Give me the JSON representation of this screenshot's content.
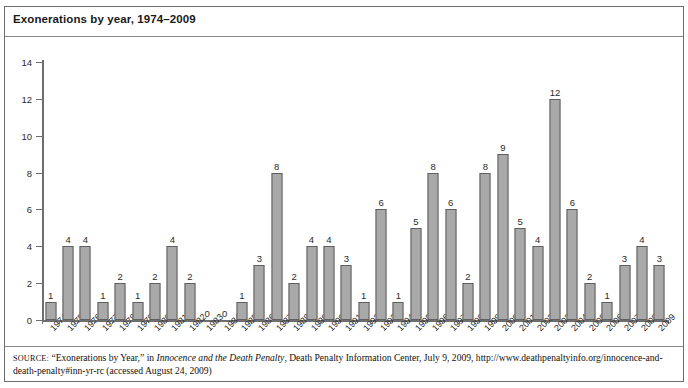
{
  "figure": {
    "title": "Exonerations by year, 1974–2009",
    "source_label": "SOURCE:",
    "source_part1": " “Exonerations by Year,” in ",
    "source_italic": "Innocence and the Death Penalty",
    "source_part2": ", Death Penalty Information Center, July 9, 2009, http://www.deathpenaltyinfo.org/innocence-and-death-penalty#inn-yr-rc (accessed August 24, 2009)"
  },
  "chart_data": {
    "type": "bar",
    "title": "Exonerations by year, 1974–2009",
    "xlabel": "",
    "ylabel": "",
    "ylim": [
      0,
      14
    ],
    "yticks": [
      0,
      2,
      4,
      6,
      8,
      10,
      12,
      14
    ],
    "grid": false,
    "legend": null,
    "bar_color": "#a9a9a9",
    "bar_edge_color": "#5f5f5f",
    "categories": [
      "1974",
      "1975",
      "1976",
      "1977",
      "1978",
      "1979",
      "1980",
      "1981",
      "1982",
      "1983",
      "1984",
      "1985",
      "1986",
      "1987",
      "1988",
      "1989",
      "1990",
      "1991",
      "1992",
      "1993",
      "1994",
      "1995",
      "1996",
      "1997",
      "1998",
      "1999",
      "2000",
      "2001",
      "2002",
      "2003",
      "2004",
      "2005",
      "2006",
      "2007",
      "2008",
      "2009"
    ],
    "values": [
      1,
      4,
      4,
      1,
      2,
      1,
      2,
      4,
      2,
      0,
      0,
      1,
      3,
      8,
      2,
      4,
      4,
      3,
      1,
      6,
      1,
      5,
      8,
      6,
      2,
      8,
      9,
      5,
      4,
      12,
      6,
      2,
      1,
      3,
      4,
      3
    ],
    "data_labels": [
      "1",
      "4",
      "4",
      "1",
      "2",
      "1",
      "2",
      "4",
      "2",
      "0",
      "0",
      "1",
      "3",
      "8",
      "2",
      "4",
      "4",
      "3",
      "1",
      "6",
      "1",
      "5",
      "8",
      "6",
      "2",
      "8",
      "9",
      "5",
      "4",
      "12",
      "6",
      "2",
      "1",
      "3",
      "4",
      "3"
    ]
  }
}
